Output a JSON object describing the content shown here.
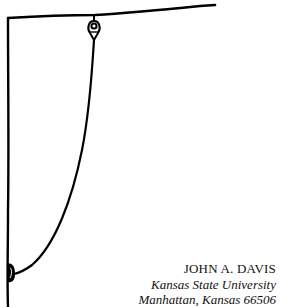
{
  "figure": {
    "icons": {
      "pulley": "pulley-icon",
      "knot": "knot-icon"
    },
    "colors": {
      "ink": "#000000",
      "paper": "#ffffff"
    }
  },
  "author": {
    "name": "JOHN A. DAVIS",
    "institution": "Kansas State University",
    "location": "Manhattan, Kansas 66506"
  }
}
